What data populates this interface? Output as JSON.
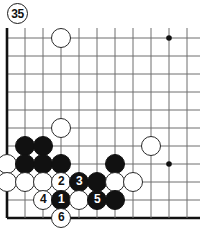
{
  "figure": {
    "label": "35"
  },
  "board": {
    "geometry": {
      "origin_x": 7,
      "origin_y": 10,
      "spacing": 18,
      "cols": 11,
      "rows": 11,
      "stone_radius": 10
    },
    "edges": {
      "left_edge": true,
      "bottom_edge": true,
      "top_edge": false,
      "right_edge": false
    },
    "star_points": [
      {
        "col": 9,
        "row": 0
      },
      {
        "col": 9,
        "row": 7
      }
    ],
    "stones": [
      {
        "color": "white",
        "col": 3,
        "row": 0,
        "label": ""
      },
      {
        "color": "white",
        "col": 3,
        "row": 5,
        "label": ""
      },
      {
        "color": "black",
        "col": 1,
        "row": 6,
        "label": ""
      },
      {
        "color": "black",
        "col": 2,
        "row": 6,
        "label": ""
      },
      {
        "color": "white",
        "col": 8,
        "row": 6,
        "label": ""
      },
      {
        "color": "white",
        "col": 0,
        "row": 7,
        "label": ""
      },
      {
        "color": "black",
        "col": 1,
        "row": 7,
        "label": ""
      },
      {
        "color": "black",
        "col": 2,
        "row": 7,
        "label": ""
      },
      {
        "color": "black",
        "col": 3,
        "row": 7,
        "label": ""
      },
      {
        "color": "black",
        "col": 6,
        "row": 7,
        "label": ""
      },
      {
        "color": "white",
        "col": 0,
        "row": 8,
        "label": ""
      },
      {
        "color": "white",
        "col": 1,
        "row": 8,
        "label": ""
      },
      {
        "color": "white",
        "col": 2,
        "row": 8,
        "label": ""
      },
      {
        "color": "white",
        "col": 3,
        "row": 8,
        "label": "2"
      },
      {
        "color": "black",
        "col": 4,
        "row": 8,
        "label": "3"
      },
      {
        "color": "black",
        "col": 5,
        "row": 8,
        "label": ""
      },
      {
        "color": "white",
        "col": 6,
        "row": 8,
        "label": ""
      },
      {
        "color": "white",
        "col": 7,
        "row": 8,
        "label": ""
      },
      {
        "color": "white",
        "col": 2,
        "row": 9,
        "label": "4"
      },
      {
        "color": "black",
        "col": 3,
        "row": 9,
        "label": "1"
      },
      {
        "color": "white",
        "col": 4,
        "row": 9,
        "label": ""
      },
      {
        "color": "black",
        "col": 5,
        "row": 9,
        "label": "5"
      },
      {
        "color": "black",
        "col": 6,
        "row": 9,
        "label": ""
      },
      {
        "color": "white",
        "col": 3,
        "row": 10,
        "label": "6"
      }
    ]
  },
  "colors": {
    "line": "#6e6e6e",
    "edge": "#111111",
    "black_stone": "#111111",
    "white_stone": "#ffffff",
    "white_stone_border": "#2a2a2a",
    "background": "#ffffff"
  }
}
